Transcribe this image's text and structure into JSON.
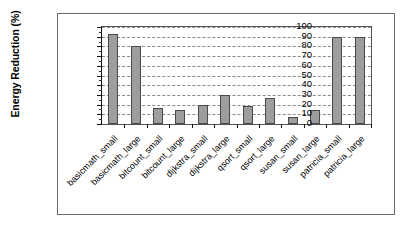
{
  "chart_data": {
    "type": "bar",
    "title": "",
    "xlabel": "",
    "ylabel": "Energy Reduction (%)",
    "ylim": [
      0,
      100
    ],
    "ytick_step": 10,
    "yticks": [
      0,
      10,
      20,
      30,
      40,
      50,
      60,
      70,
      80,
      90,
      100
    ],
    "grid": true,
    "grid_style": "dashed-horizontal",
    "legend": false,
    "legend_position": "none",
    "categories": [
      "basicmath_small",
      "basicmath_large",
      "bitcount_small",
      "bitcount_large",
      "dijkstra_small",
      "dijkstra_large",
      "qsort_small",
      "qsort_large",
      "susan_small",
      "susan_large",
      "patricia_small",
      "patricia_large"
    ],
    "values": [
      93,
      80,
      17,
      14,
      20,
      30,
      19,
      27,
      7,
      14,
      90,
      90
    ],
    "bar_color": "#9d9d9d",
    "bar_edge_color": "#4a4a4a"
  }
}
